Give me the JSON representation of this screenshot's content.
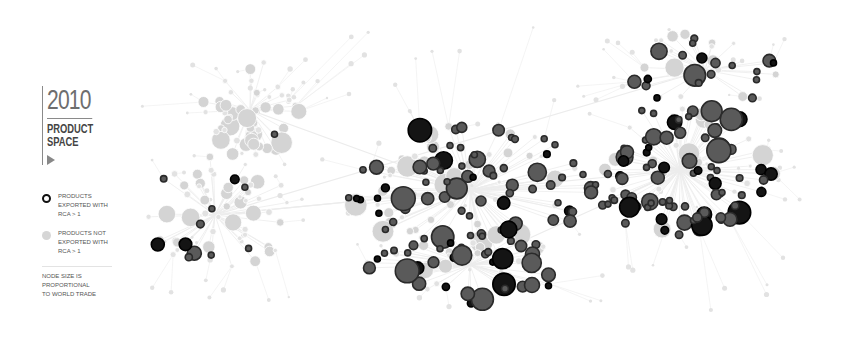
{
  "header": {
    "year": "2010",
    "title_line1": "PRODUCT",
    "title_line2": "SPACE",
    "play_icon": "play-triangle-icon"
  },
  "legend": {
    "exported": {
      "label_line1": "PRODUCTS",
      "label_line2": "EXPORTED WITH",
      "label_line3": "RCA > 1",
      "icon": "dark-ring-node-icon"
    },
    "not_exported": {
      "label_line1": "PRODUCTS NOT",
      "label_line2": "EXPORTED WITH",
      "label_line3": "RCA > 1",
      "icon": "light-node-icon"
    },
    "note_line1": "NODE SIZE IS PROPORTIONAL",
    "note_line2": "TO WORLD TRADE"
  },
  "colors": {
    "exported_fill": "#5a5a5a",
    "exported_ring": "#2a2a2a",
    "exported_black": "#141414",
    "not_exported": "#d4d4d4",
    "not_exported_small": "#e2e2e2",
    "edge": "#ececec",
    "text_dark": "#444444",
    "text_year": "#6e6e6e"
  },
  "network": {
    "clusters": [
      {
        "name": "garments-cluster",
        "exported_share": 0.05,
        "node_count": 55
      },
      {
        "name": "agriculture-left-cluster",
        "exported_share": 0.15,
        "node_count": 60
      },
      {
        "name": "core-cluster",
        "exported_share": 0.55,
        "node_count": 120
      },
      {
        "name": "machinery-right-cluster",
        "exported_share": 0.7,
        "node_count": 110
      },
      {
        "name": "chemicals-lower-cluster",
        "exported_share": 0.6,
        "node_count": 60
      },
      {
        "name": "electronics-upper-right-cluster",
        "exported_share": 0.65,
        "node_count": 35
      }
    ]
  }
}
